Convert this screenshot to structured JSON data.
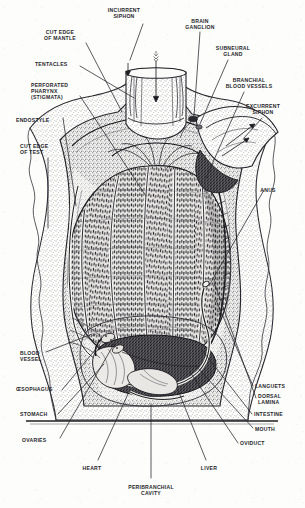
{
  "figure": {
    "ink_color": "#26262a",
    "paper_color": "#fdfdfc",
    "labels": [
      {
        "id": "incurrent-siphon",
        "text": "INCURRENT\nSIPHON",
        "x": 124,
        "y": 8,
        "align": "c"
      },
      {
        "id": "brain-ganglion",
        "text": "BRAIN\nGANGLION",
        "x": 200,
        "y": 19,
        "align": "c"
      },
      {
        "id": "cut-edge-of-mantle",
        "text": "CUT EDGE\nOF MANTLE",
        "x": 60,
        "y": 30,
        "align": "c"
      },
      {
        "id": "subneural-gland",
        "text": "SUBNEURAL\nGLAND",
        "x": 233,
        "y": 46,
        "align": "c"
      },
      {
        "id": "tentacles",
        "text": "TENTACLES",
        "x": 35,
        "y": 62,
        "align": "l"
      },
      {
        "id": "branchial-blood-vessels",
        "text": "BRANCHIAL\nBLOOD VESSELS",
        "x": 249,
        "y": 78,
        "align": "c"
      },
      {
        "id": "perforated-pharynx",
        "text": "PERFORATED\nPHARYNX\n(STIGMATA)",
        "x": 31,
        "y": 83,
        "align": "l"
      },
      {
        "id": "excurrent-siphon",
        "text": "EXCURRENT\nSIPHON",
        "x": 263,
        "y": 104,
        "align": "c"
      },
      {
        "id": "endostyle",
        "text": "ENDOSTYLE",
        "x": 16,
        "y": 118,
        "align": "l"
      },
      {
        "id": "cut-edge-of-test",
        "text": "CUT EDGE\nOF TEST",
        "x": 20,
        "y": 144,
        "align": "l"
      },
      {
        "id": "anus",
        "text": "ANUS",
        "x": 268,
        "y": 188,
        "align": "c"
      },
      {
        "id": "blood-vessel",
        "text": "BLOOD\nVESSEL",
        "x": 20,
        "y": 351,
        "align": "l"
      },
      {
        "id": "languets",
        "text": "LANGUETS",
        "x": 255,
        "y": 384,
        "align": "l"
      },
      {
        "id": "oesophagus",
        "text": "ŒSOPHAGUS",
        "x": 16,
        "y": 387,
        "align": "l"
      },
      {
        "id": "dorsal-lamina",
        "text": "DORSAL\nLAMINA",
        "x": 258,
        "y": 394,
        "align": "l"
      },
      {
        "id": "stomach",
        "text": "STOMACH",
        "x": 20,
        "y": 412,
        "align": "l"
      },
      {
        "id": "intestine",
        "text": "INTESTINE",
        "x": 254,
        "y": 412,
        "align": "l"
      },
      {
        "id": "mouth",
        "text": "MOUTH",
        "x": 255,
        "y": 427,
        "align": "l"
      },
      {
        "id": "ovaries",
        "text": "OVARIES",
        "x": 22,
        "y": 438,
        "align": "l"
      },
      {
        "id": "oviduct",
        "text": "OVIDUCT",
        "x": 240,
        "y": 441,
        "align": "l"
      },
      {
        "id": "heart",
        "text": "HEART",
        "x": 92,
        "y": 466,
        "align": "c"
      },
      {
        "id": "liver",
        "text": "LIVER",
        "x": 209,
        "y": 466,
        "align": "c"
      },
      {
        "id": "peribranchial-cavity",
        "text": "PERIBRANCHIAL\nCAVITY",
        "x": 151,
        "y": 485,
        "align": "c"
      }
    ]
  }
}
